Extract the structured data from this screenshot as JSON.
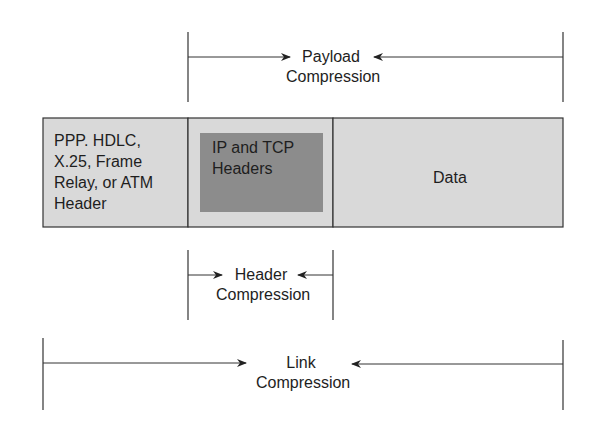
{
  "diagram": {
    "packet": {
      "link_header": {
        "lines": [
          "PPP. HDLC,",
          "X.25, Frame",
          "Relay, or ATM",
          "Header"
        ],
        "fill": "#d9d9d9"
      },
      "ip_tcp_headers": {
        "lines": [
          "IP and TCP",
          "Headers"
        ],
        "fill": "#8c8c8c"
      },
      "data": {
        "label": "Data",
        "fill": "#d9d9d9"
      }
    },
    "ranges": {
      "payload": {
        "line1": "Payload",
        "line2": "Compression"
      },
      "header": {
        "line1": "Header",
        "line2": "Compression"
      },
      "link": {
        "line1": "Link",
        "line2": "Compression"
      }
    },
    "colors": {
      "stroke": "#333333",
      "light_fill": "#d9d9d9",
      "dark_fill": "#8c8c8c"
    }
  }
}
